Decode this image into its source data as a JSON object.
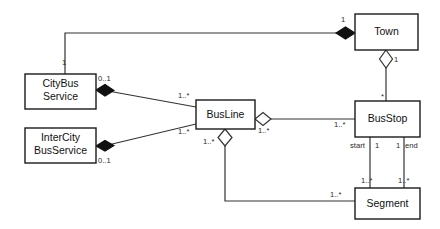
{
  "diagram": {
    "type": "uml-class-diagram",
    "title": "",
    "background_color": "#ffffff",
    "line_color": "#333333",
    "box_fill": "#ffffff",
    "box_stroke": "#1a1a1a",
    "classes": [
      {
        "id": "citybus",
        "name_line1": "CityBus",
        "name_line2": "Service",
        "x": 25,
        "y": 74,
        "w": 71,
        "h": 35
      },
      {
        "id": "intercity",
        "name_line1": "InterCity",
        "name_line2": "BusService",
        "x": 25,
        "y": 128,
        "w": 71,
        "h": 35
      },
      {
        "id": "busline",
        "name_line1": "BusLine",
        "name_line2": "",
        "x": 196,
        "y": 100,
        "w": 59,
        "h": 29
      },
      {
        "id": "town",
        "name_line1": "Town",
        "name_line2": "",
        "x": 355,
        "y": 14,
        "w": 63,
        "h": 36
      },
      {
        "id": "busstop",
        "name_line1": "BusStop",
        "name_line2": "",
        "x": 355,
        "y": 101,
        "w": 65,
        "h": 36
      },
      {
        "id": "segment",
        "name_line1": "Segment",
        "name_line2": "",
        "x": 355,
        "y": 188,
        "w": 65,
        "h": 31
      }
    ],
    "multiplicities": [
      {
        "id": "m-citybus-town",
        "text": "1",
        "x": 62,
        "y": 65
      },
      {
        "id": "m-town-left",
        "text": "1",
        "x": 341,
        "y": 22
      },
      {
        "id": "m-citybus-busline",
        "text": "0..1",
        "x": 98,
        "y": 81
      },
      {
        "id": "m-intercity-busline",
        "text": "0..1",
        "x": 98,
        "y": 163
      },
      {
        "id": "m-busline-citybus",
        "text": "1..*",
        "x": 178,
        "y": 98
      },
      {
        "id": "m-busline-intercity",
        "text": "1..*",
        "x": 178,
        "y": 134
      },
      {
        "id": "m-busline-busstop",
        "text": "1..*",
        "x": 258,
        "y": 133
      },
      {
        "id": "m-busstop-busline",
        "text": "1..*",
        "x": 334,
        "y": 127
      },
      {
        "id": "m-town-busstop",
        "text": "1",
        "x": 394,
        "y": 62
      },
      {
        "id": "m-busstop-town",
        "text": "*",
        "x": 381,
        "y": 97
      },
      {
        "id": "m-busline-segment",
        "text": "1..*",
        "x": 203,
        "y": 144
      },
      {
        "id": "m-segment-busline",
        "text": "1..*",
        "x": 330,
        "y": 197
      },
      {
        "id": "m-start-one",
        "text": "1",
        "x": 375,
        "y": 148
      },
      {
        "id": "m-end-one",
        "text": "1",
        "x": 396,
        "y": 148
      },
      {
        "id": "m-segment-start",
        "text": "1..*",
        "x": 361,
        "y": 183
      },
      {
        "id": "m-segment-end",
        "text": "1..*",
        "x": 398,
        "y": 183
      }
    ],
    "roles": [
      {
        "id": "role-start",
        "text": "start",
        "x": 352,
        "y": 148
      },
      {
        "id": "role-end",
        "text": "end",
        "x": 404,
        "y": 148
      }
    ],
    "relations": [
      {
        "id": "rel-town-citybus",
        "source": "town",
        "target": "citybus",
        "kind": "composition",
        "diamond": "filled"
      },
      {
        "id": "rel-citybus-busline",
        "source": "citybus",
        "target": "busline",
        "kind": "composition",
        "diamond": "filled"
      },
      {
        "id": "rel-intercity-busline",
        "source": "intercity",
        "target": "busline",
        "kind": "composition",
        "diamond": "filled"
      },
      {
        "id": "rel-busline-busstop",
        "source": "busline",
        "target": "busstop",
        "kind": "aggregation",
        "diamond": "hollow"
      },
      {
        "id": "rel-town-busstop",
        "source": "town",
        "target": "busstop",
        "kind": "aggregation",
        "diamond": "hollow"
      },
      {
        "id": "rel-busline-segment",
        "source": "busline",
        "target": "segment",
        "kind": "aggregation",
        "diamond": "hollow"
      },
      {
        "id": "rel-busstop-segment-start",
        "source": "busstop",
        "target": "segment",
        "kind": "association",
        "diamond": "none"
      },
      {
        "id": "rel-busstop-segment-end",
        "source": "busstop",
        "target": "segment",
        "kind": "association",
        "diamond": "none"
      }
    ]
  }
}
